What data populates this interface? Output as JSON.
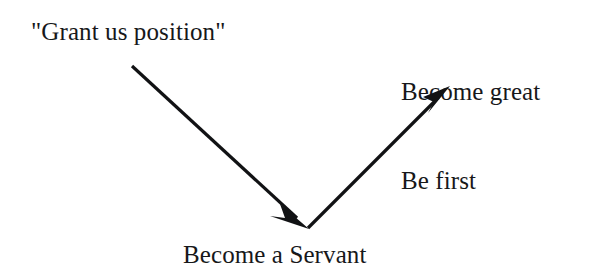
{
  "diagram": {
    "title_text_top_left": "\"Grant us position\"",
    "background_color": "#ffffff",
    "ink_color": "#111214",
    "labels": {
      "request": "\"Grant us position\"",
      "outcome_line1": "Become great",
      "outcome_line2": "Be first",
      "path": "Become a Servant"
    },
    "arrows": [
      {
        "name": "request-to-servant",
        "from_label": "\"Grant us position\"",
        "to_label": "Become a Servant",
        "direction": "down-right",
        "start": [
          132,
          66
        ],
        "end": [
          308,
          228
        ]
      },
      {
        "name": "servant-to-greatness",
        "from_label": "Become a Servant",
        "to_label": "Become great / Be first",
        "direction": "up-right",
        "start": [
          308,
          228
        ],
        "end": [
          450,
          86
        ]
      }
    ]
  }
}
